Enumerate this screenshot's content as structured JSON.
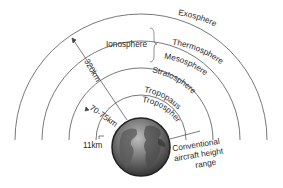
{
  "diagram": {
    "layers": [
      {
        "name": "Exosphere"
      },
      {
        "name": "Thermosphere"
      },
      {
        "name": "Mesosphere"
      },
      {
        "name": "Stratosphere"
      },
      {
        "name": "Tropopause"
      },
      {
        "name": "Troposphere"
      }
    ],
    "ionosphere_label": "Ionosphere",
    "heights": {
      "h320": "320km",
      "h70": "70-75km",
      "h11": "11km"
    },
    "aircraft_label": {
      "line1": "Conventional",
      "line2": "aircraft height",
      "line3": "range"
    },
    "colors": {
      "line": "#555555",
      "globe_dark": "#2b2b2b",
      "globe_light": "#9a9a9a"
    }
  }
}
